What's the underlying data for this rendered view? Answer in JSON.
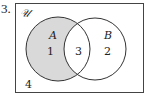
{
  "problem_number": "3.",
  "diagram": {
    "type": "venn",
    "universe_label": "𝒰",
    "sets": [
      {
        "name": "A",
        "only_count": "1"
      },
      {
        "name": "B",
        "only_count": "2"
      }
    ],
    "intersection_count": "3",
    "outside_count": "4",
    "shaded_region": "A only",
    "shade_color": "#d9d9d9",
    "line_color": "#333333"
  }
}
